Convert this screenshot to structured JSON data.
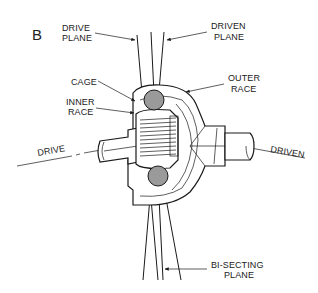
{
  "figure": {
    "panel_letter": "B",
    "labels": {
      "drive_plane": [
        "DRIVE",
        "PLANE"
      ],
      "driven_plane": [
        "DRIVEN",
        "PLANE"
      ],
      "cage": "CAGE",
      "inner_race": [
        "INNER",
        "RACE"
      ],
      "outer_race": [
        "OUTER",
        "RACE"
      ],
      "drive_axis": "DRIVE",
      "driven_axis": "DRIVEN",
      "bisecting_plane": [
        "BI-SECTING",
        "PLANE"
      ]
    },
    "colors": {
      "line": "#1a1a1a",
      "ball_fill": "#9a9a9a",
      "background": "#ffffff"
    }
  }
}
